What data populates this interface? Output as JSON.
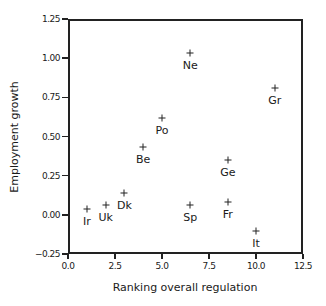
{
  "chart_data": {
    "type": "scatter",
    "title": "",
    "xlabel": "Ranking overall regulation",
    "ylabel": "Employment growth",
    "xlim": [
      0.0,
      12.5
    ],
    "ylim": [
      -0.25,
      1.25
    ],
    "xticks": [
      "0.0",
      "2.5",
      "5.0",
      "7.5",
      "10.0",
      "12.5"
    ],
    "yticks": [
      "1.25",
      "1.00",
      "0.75",
      "0.50",
      "0.25",
      "0.00",
      "-0.25"
    ],
    "grid": false,
    "legend": null,
    "marker": "+",
    "points": [
      {
        "label": "Ir",
        "x": 1.0,
        "y": 0.04
      },
      {
        "label": "Uk",
        "x": 2.0,
        "y": 0.06
      },
      {
        "label": "Dk",
        "x": 3.0,
        "y": 0.14
      },
      {
        "label": "Be",
        "x": 4.0,
        "y": 0.43
      },
      {
        "label": "Po",
        "x": 5.0,
        "y": 0.62
      },
      {
        "label": "Ne",
        "x": 6.5,
        "y": 1.03
      },
      {
        "label": "Sp",
        "x": 6.5,
        "y": 0.06
      },
      {
        "label": "Ge",
        "x": 8.5,
        "y": 0.35
      },
      {
        "label": "Fr",
        "x": 8.5,
        "y": 0.08
      },
      {
        "label": "It",
        "x": 10.0,
        "y": -0.1
      },
      {
        "label": "Gr",
        "x": 11.0,
        "y": 0.81
      }
    ]
  }
}
